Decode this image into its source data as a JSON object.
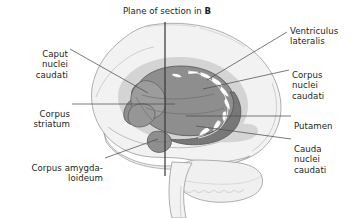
{
  "figure": {
    "title": "Plane of section in",
    "title_bold_suffix": "B",
    "type": "anatomical-diagram",
    "background_color": "#ffffff",
    "colors": {
      "brain_fill": "#f2f2f2",
      "brain_outline": "#9a9a9a",
      "halo_fill": "#cfcfcf",
      "striatum_fill": "#8e8e8e",
      "striatum_outline": "#5a5a5a",
      "caudate_fill": "#9a9a9a",
      "white_striation": "#ffffff",
      "leader_line": "#4d4d4d",
      "section_line": "#3a3a3a",
      "text": "#231f20"
    }
  },
  "labels": [
    {
      "id": "caput-nuclei-caudati",
      "text": "Caput\nnuclei\ncaudati",
      "side": "left"
    },
    {
      "id": "corpus-striatum",
      "text": "Corpus\nstriatum",
      "side": "left"
    },
    {
      "id": "corpus-amygdaloideum",
      "text": "Corpus amygda-\nloideum",
      "side": "left"
    },
    {
      "id": "ventriculus-lateralis",
      "text": "Ventriculus\nlateralis",
      "side": "right"
    },
    {
      "id": "corpus-nuclei-caudati",
      "text": "Corpus\nnuclei\ncaudati",
      "side": "right"
    },
    {
      "id": "putamen",
      "text": "Putamen",
      "side": "right"
    },
    {
      "id": "cauda-nuclei-caudati",
      "text": "Cauda\nnuclei\ncaudati",
      "side": "right"
    }
  ]
}
